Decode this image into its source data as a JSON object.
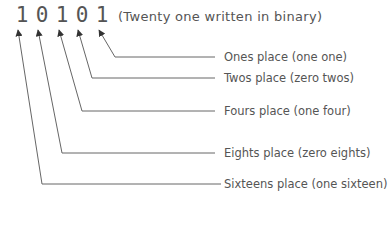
{
  "diagram": {
    "binary_digits": [
      "1",
      "0",
      "1",
      "0",
      "1"
    ],
    "caption": "(Twenty one written in binary)",
    "labels": [
      "Ones place (one one)",
      "Twos place (zero twos)",
      "Fours place (one four)",
      "Eights place (zero eights)",
      "Sixteens place (one sixteen)"
    ],
    "colors": {
      "text": "#555555",
      "line": "#666666",
      "background": "#ffffff"
    }
  }
}
